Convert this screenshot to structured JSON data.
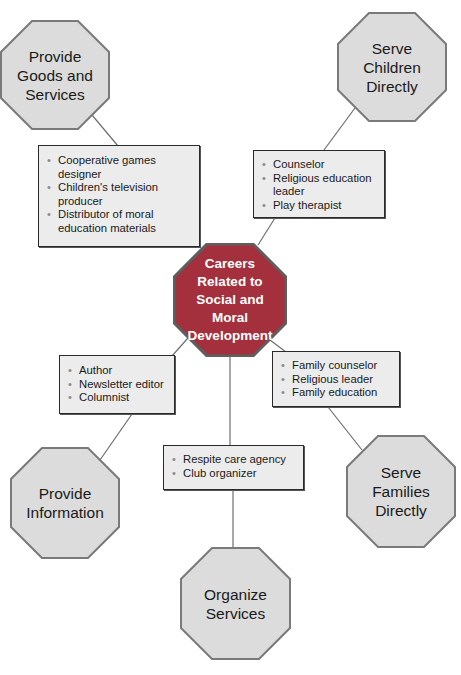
{
  "title": "Careers Related to Social and Moral Development",
  "colors": {
    "outer_octagon_fill": "#dcdcdc",
    "outer_octagon_stroke": "#7a7a7a",
    "center_octagon_fill": "#a3303c",
    "center_octagon_stroke": "#5e5e5e",
    "box_fill": "#ececec",
    "box_border": "#2a2a2a",
    "connector": "#6e6e6e"
  },
  "center": {
    "label": "Careers\nRelated to\nSocial and\nMoral\nDevelopment"
  },
  "categories": [
    {
      "id": "goods-services",
      "label": "Provide\nGoods and\nServices",
      "items": [
        "Cooperative games designer",
        "Children's television producer",
        "Distributor of moral education materials"
      ]
    },
    {
      "id": "serve-children",
      "label": "Serve\nChildren\nDirectly",
      "items": [
        "Counselor",
        "Religious education leader",
        "Play therapist"
      ]
    },
    {
      "id": "provide-information",
      "label": "Provide\nInformation",
      "items": [
        "Author",
        "Newsletter editor",
        "Columnist"
      ]
    },
    {
      "id": "serve-families",
      "label": "Serve\nFamilies\nDirectly",
      "items": [
        "Family counselor",
        "Religious leader",
        "Family education"
      ]
    },
    {
      "id": "organize-services",
      "label": "Organize\nServices",
      "items": [
        "Respite care agency",
        "Club organizer"
      ]
    }
  ]
}
